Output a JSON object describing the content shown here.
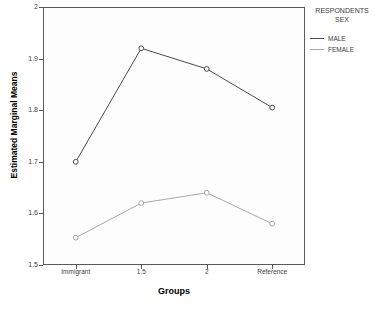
{
  "chart_data": {
    "type": "line",
    "title": "",
    "xlabel": "Groups",
    "ylabel": "Estimated Marginal Means",
    "categories": [
      "Immigrant",
      "1.5",
      "2",
      "Reference"
    ],
    "series": [
      {
        "name": "MALE",
        "values": [
          1.7,
          1.92,
          1.88,
          1.805
        ],
        "color": "#4a4a52"
      },
      {
        "name": "FEMALE",
        "values": [
          1.553,
          1.62,
          1.64,
          1.58
        ],
        "color": "#a8a8ae"
      }
    ],
    "ylim": [
      1.5,
      2.0
    ],
    "yticks": [
      2,
      1.9,
      1.8,
      1.7,
      1.6,
      1.5
    ],
    "ytick_labels": [
      "2",
      "1.9",
      "1.8",
      "1.7",
      "1.6",
      "1.5"
    ],
    "grid": false,
    "legend_position": "right",
    "legend_title": "RESPONDENTS SEX",
    "markers": "open-circle"
  },
  "legend": {
    "title_line1": "RESPONDENTS",
    "title_line2": "SEX",
    "entries": [
      {
        "label": "MALE",
        "color": "#4a4a52"
      },
      {
        "label": "FEMALE",
        "color": "#a8a8ae"
      }
    ]
  },
  "axes": {
    "y_title": "Estimated Marginal Means",
    "x_title": "Groups",
    "y_tick_labels": [
      "2",
      "1.9",
      "1.8",
      "1.7",
      "1.6",
      "1.5"
    ],
    "x_tick_labels": [
      "Immigrant",
      "1.5",
      "2",
      "Reference"
    ]
  },
  "clipped_title": ""
}
